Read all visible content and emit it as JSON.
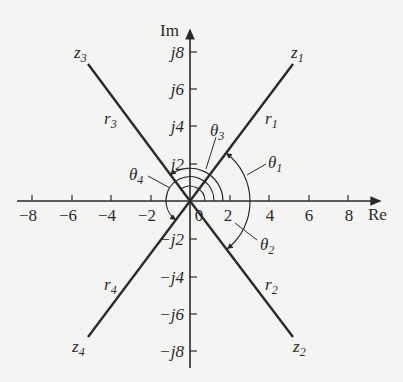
{
  "diagram": {
    "axes": {
      "real_label": "Re",
      "imag_label": "Im",
      "real_ticks": [
        "−8",
        "−6",
        "−4",
        "−2",
        "0",
        "2",
        "4",
        "6",
        "8"
      ],
      "imag_ticks_pos": [
        "j2",
        "j4",
        "j6",
        "j8"
      ],
      "imag_ticks_neg": [
        "−j2",
        "−j4",
        "−j6",
        "−j8"
      ]
    },
    "points": [
      {
        "name": "z",
        "sub": "1",
        "radius_label": "r",
        "radius_sub": "1",
        "re": 6,
        "im": 8
      },
      {
        "name": "z",
        "sub": "2",
        "radius_label": "r",
        "radius_sub": "2",
        "re": 6,
        "im": -8
      },
      {
        "name": "z",
        "sub": "3",
        "radius_label": "r",
        "radius_sub": "3",
        "re": -6,
        "im": 8
      },
      {
        "name": "z",
        "sub": "4",
        "radius_label": "r",
        "radius_sub": "4",
        "re": -6,
        "im": -8
      }
    ],
    "angles": [
      {
        "label": "θ",
        "sub": "1"
      },
      {
        "label": "θ",
        "sub": "2"
      },
      {
        "label": "θ",
        "sub": "3"
      },
      {
        "label": "θ",
        "sub": "4"
      }
    ],
    "colors": {
      "line": "#2a2a2a",
      "background": "#f4f4f2"
    }
  }
}
